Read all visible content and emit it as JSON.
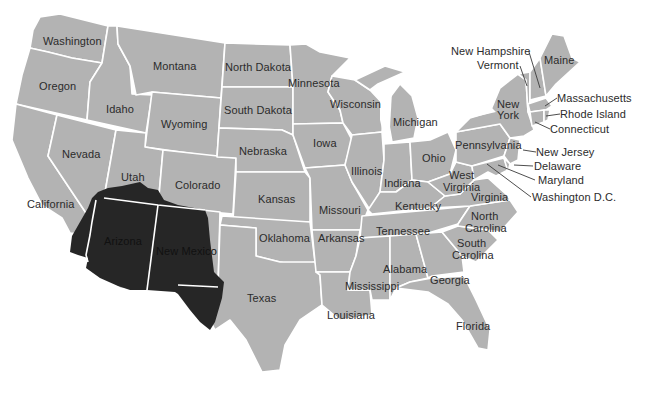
{
  "map": {
    "title": "",
    "base_color": "#b3b3b3",
    "border_color": "#ffffff",
    "highlight_color": "#262626",
    "label_color": "#2b2b2b",
    "highlighted_region": {
      "description": "Dark shaded region covering Arizona, New Mexico, southern Utah, southwest Colorado and far west Texas",
      "states_covered": [
        "Arizona",
        "New Mexico"
      ]
    },
    "labels": {
      "washington": "Washington",
      "oregon": "Oregon",
      "california": "California",
      "nevada": "Nevada",
      "idaho": "Idaho",
      "montana": "Montana",
      "wyoming": "Wyoming",
      "utah": "Utah",
      "colorado": "Colorado",
      "arizona": "Arizona",
      "new_mexico": "New Mexico",
      "north_dakota": "North Dakota",
      "south_dakota": "South Dakota",
      "nebraska": "Nebraska",
      "kansas": "Kansas",
      "oklahoma": "Oklahoma",
      "texas": "Texas",
      "minnesota": "Minnesota",
      "iowa": "Iowa",
      "missouri": "Missouri",
      "arkansas": "Arkansas",
      "louisiana": "Louisiana",
      "wisconsin": "Wisconsin",
      "illinois": "Illinois",
      "michigan": "Michigan",
      "indiana": "Indiana",
      "ohio": "Ohio",
      "kentucky": "Kentucky",
      "tennessee": "Tennessee",
      "mississippi": "Mississippi",
      "alabama": "Alabama",
      "georgia": "Georgia",
      "florida": "Florida",
      "south_carolina_1": "South",
      "south_carolina_2": "Carolina",
      "north_carolina_1": "North",
      "north_carolina_2": "Carolina",
      "virginia": "Virginia",
      "west_virginia_1": "West",
      "west_virginia_2": "Virginia",
      "pennsylvania": "Pennsylvania",
      "new_york_1": "New",
      "new_york_2": "York",
      "maine": "Maine",
      "new_hampshire": "New Hampshire",
      "vermont": "Vermont",
      "massachusetts": "Massachusetts",
      "rhode_island": "Rhode Island",
      "connecticut": "Connecticut",
      "new_jersey": "New Jersey",
      "delaware": "Delaware",
      "maryland": "Maryland",
      "washington_dc": "Washington D.C."
    }
  }
}
